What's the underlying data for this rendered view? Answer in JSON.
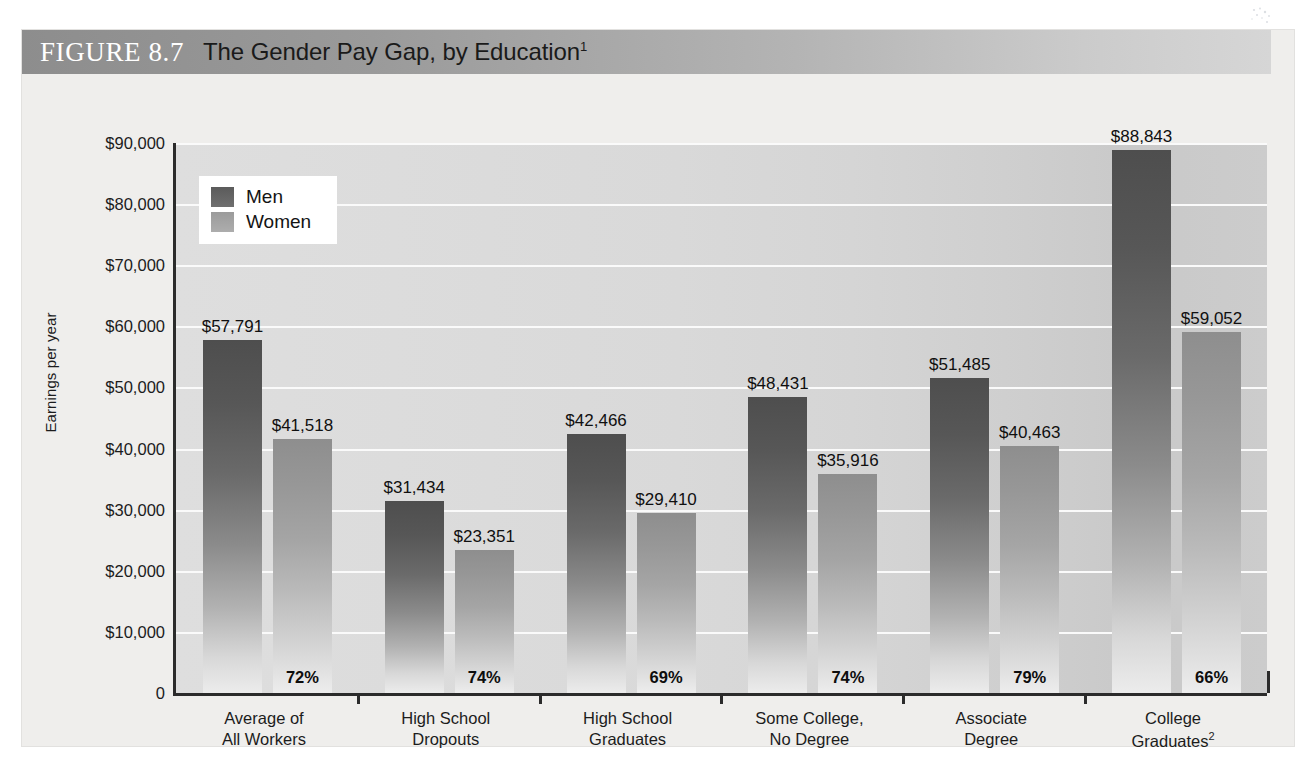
{
  "figure": {
    "number_label": "FIGURE 8.7",
    "title": "The Gender Pay Gap, by Education",
    "title_superscript": "1"
  },
  "axes": {
    "y_axis_title": "Earnings per year",
    "y_ticks": [
      "$90,000",
      "$80,000",
      "$70,000",
      "$60,000",
      "$50,000",
      "$40,000",
      "$30,000",
      "$20,000",
      "$10,000",
      "0"
    ],
    "y_min": 0,
    "y_max": 90000,
    "y_step": 10000
  },
  "legend": {
    "items": [
      {
        "label": "Men",
        "color": "#5b5b5b"
      },
      {
        "label": "Women",
        "color": "#9b9b9b"
      }
    ]
  },
  "groups": [
    {
      "label_line1": "Average of",
      "label_line2": "All Workers",
      "superscript": "",
      "men_value": "$57,791",
      "women_value": "$41,518",
      "ratio": "72%",
      "men_num": 57791,
      "women_num": 41518
    },
    {
      "label_line1": "High School",
      "label_line2": "Dropouts",
      "superscript": "",
      "men_value": "$31,434",
      "women_value": "$23,351",
      "ratio": "74%",
      "men_num": 31434,
      "women_num": 23351
    },
    {
      "label_line1": "High School",
      "label_line2": "Graduates",
      "superscript": "",
      "men_value": "$42,466",
      "women_value": "$29,410",
      "ratio": "69%",
      "men_num": 42466,
      "women_num": 29410
    },
    {
      "label_line1": "Some College,",
      "label_line2": "No Degree",
      "superscript": "",
      "men_value": "$48,431",
      "women_value": "$35,916",
      "ratio": "74%",
      "men_num": 48431,
      "women_num": 35916
    },
    {
      "label_line1": "Associate",
      "label_line2": "Degree",
      "superscript": "",
      "men_value": "$51,485",
      "women_value": "$40,463",
      "ratio": "79%",
      "men_num": 51485,
      "women_num": 40463
    },
    {
      "label_line1": "College",
      "label_line2": "Graduates",
      "superscript": "2",
      "men_value": "$88,843",
      "women_value": "$59,052",
      "ratio": "66%",
      "men_num": 88843,
      "women_num": 59052
    }
  ],
  "chart_data": {
    "type": "bar",
    "title": "FIGURE 8.7  The Gender Pay Gap, by Education",
    "xlabel": "",
    "ylabel": "Earnings per year",
    "ylim": [
      0,
      90000
    ],
    "ytick_step": 10000,
    "grid": true,
    "legend_position": "upper-left-inside",
    "categories": [
      "Average of All Workers",
      "High School Dropouts",
      "High School Graduates",
      "Some College, No Degree",
      "Associate Degree",
      "College Graduates"
    ],
    "series": [
      {
        "name": "Men",
        "color": "#5b5b5b",
        "values": [
          57791,
          31434,
          42466,
          48431,
          51485,
          88843
        ]
      },
      {
        "name": "Women",
        "color": "#9b9b9b",
        "values": [
          41518,
          23351,
          29410,
          35916,
          40463,
          59052
        ]
      }
    ],
    "annotations": {
      "name": "women-to-men earnings ratio",
      "values": [
        "72%",
        "74%",
        "69%",
        "74%",
        "79%",
        "66%"
      ]
    }
  }
}
